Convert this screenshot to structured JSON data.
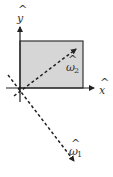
{
  "diagram": {
    "colors": {
      "square_fill": "#d6d6d6",
      "line": "#333333",
      "background": "#ffffff"
    },
    "axes": {
      "x_label": "x",
      "x_hat": "^",
      "y_label": "y",
      "y_hat": "^"
    },
    "vectors": [
      {
        "name": "omega1",
        "label": "ω",
        "hat": "^",
        "subscript": "1",
        "direction": "down-right (diagonal, -45°)",
        "style": "dashed"
      },
      {
        "name": "omega2",
        "label": "ω",
        "hat": "^",
        "subscript": "2",
        "direction": "up-right (diagonal, +45°)",
        "style": "dashed"
      }
    ],
    "square": {
      "label": "unit square",
      "corner": "origin"
    }
  }
}
